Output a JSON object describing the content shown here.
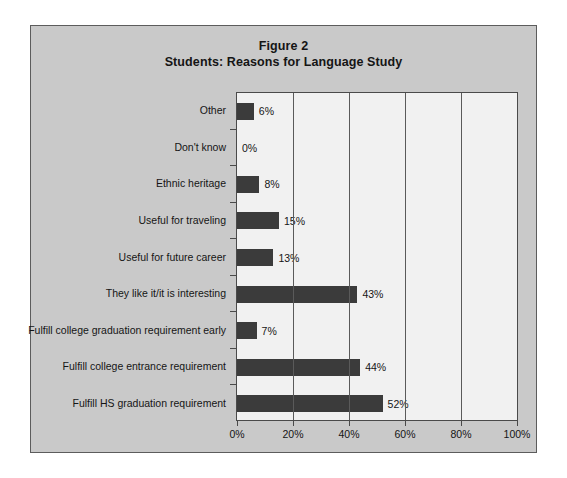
{
  "figure": {
    "title_line1": "Figure 2",
    "title_line2": "Students: Reasons for Language Study"
  },
  "chart_data": {
    "type": "bar",
    "orientation": "horizontal",
    "xlabel": "",
    "ylabel": "",
    "xlim": [
      0,
      100
    ],
    "xticks": [
      0,
      20,
      40,
      60,
      80,
      100
    ],
    "xtick_labels": [
      "0%",
      "20%",
      "40%",
      "60%",
      "80%",
      "100%"
    ],
    "grid": true,
    "legend": false,
    "bar_color": "#3b3b3b",
    "plot_bg": "#f1f1f1",
    "panel_bg": "#c9c9c9",
    "categories": [
      "Other",
      "Don't know",
      "Ethnic heritage",
      "Useful for traveling",
      "Useful for future career",
      "They like it/it is interesting",
      "Fulfill college graduation requirement early",
      "Fulfill college entrance requirement",
      "Fulfill HS graduation requirement"
    ],
    "values": [
      6,
      0,
      8,
      15,
      13,
      43,
      7,
      44,
      52
    ],
    "value_labels": [
      "6%",
      "0%",
      "8%",
      "15%",
      "13%",
      "43%",
      "7%",
      "44%",
      "52%"
    ]
  }
}
